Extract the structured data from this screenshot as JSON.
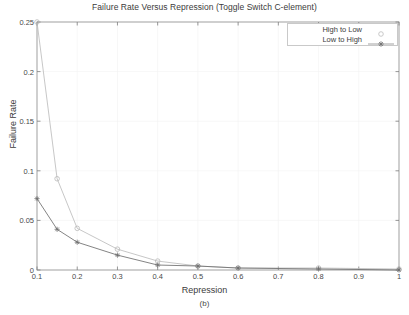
{
  "chart_data": {
    "type": "line",
    "title": "Failure Rate Versus Repression (Toggle Switch C-element)",
    "xlabel": "Repression",
    "ylabel": "Failure Rate",
    "caption": "(b)",
    "xlim": [
      0.1,
      1.0
    ],
    "ylim": [
      0,
      0.25
    ],
    "xticks": [
      "0.1",
      "0.2",
      "0.3",
      "0.4",
      "0.5",
      "0.6",
      "0.7",
      "0.8",
      "0.9",
      "1"
    ],
    "xtick_values": [
      0.1,
      0.2,
      0.3,
      0.4,
      0.5,
      0.6,
      0.7,
      0.8,
      0.9,
      1.0
    ],
    "yticks": [
      "0",
      "0.05",
      "0.1",
      "0.15",
      "0.2",
      "0.25"
    ],
    "ytick_values": [
      0,
      0.05,
      0.1,
      0.15,
      0.2,
      0.25
    ],
    "grid": true,
    "legend_position": "top-right",
    "series": [
      {
        "name": "High to Low",
        "marker": "circle",
        "color": "#b9b9b9",
        "x": [
          0.1,
          0.15,
          0.2,
          0.3,
          0.4,
          0.5,
          0.6,
          0.8,
          1.0
        ],
        "values": [
          0.25,
          0.092,
          0.042,
          0.021,
          0.009,
          0.004,
          0.002,
          0.002,
          0.001
        ]
      },
      {
        "name": "Low to High",
        "marker": "star",
        "color": "#6e6e6e",
        "x": [
          0.1,
          0.15,
          0.2,
          0.3,
          0.4,
          0.5,
          0.6,
          0.8,
          1.0
        ],
        "values": [
          0.072,
          0.041,
          0.028,
          0.015,
          0.005,
          0.004,
          0.002,
          0.001,
          0.0
        ]
      }
    ]
  },
  "legend": {
    "items": [
      {
        "label": "High to Low"
      },
      {
        "label": "Low to High"
      }
    ]
  }
}
